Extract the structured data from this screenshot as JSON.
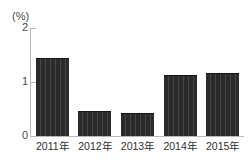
{
  "chart_data": {
    "type": "bar",
    "title": "",
    "subtitle": "",
    "xlabel": "",
    "ylabel": "(%)",
    "unit_label": "(%)",
    "categories": [
      "2011年",
      "2012年",
      "2013年",
      "2014年",
      "2015年"
    ],
    "values": [
      1.45,
      0.47,
      0.43,
      1.13,
      1.17
    ],
    "series": [
      {
        "name": "",
        "values": [
          1.45,
          0.47,
          0.43,
          1.13,
          1.17
        ]
      }
    ],
    "ylim": [
      0,
      2
    ],
    "yticks": [
      0,
      1,
      2
    ],
    "ytick_labels": [
      "0",
      "1",
      "2"
    ],
    "grid": false,
    "legend": false,
    "legend_position": "none",
    "bar_color": "#2b2b2b",
    "axis_color": "#b9b9b9",
    "text_color": "#2e2e2e"
  }
}
